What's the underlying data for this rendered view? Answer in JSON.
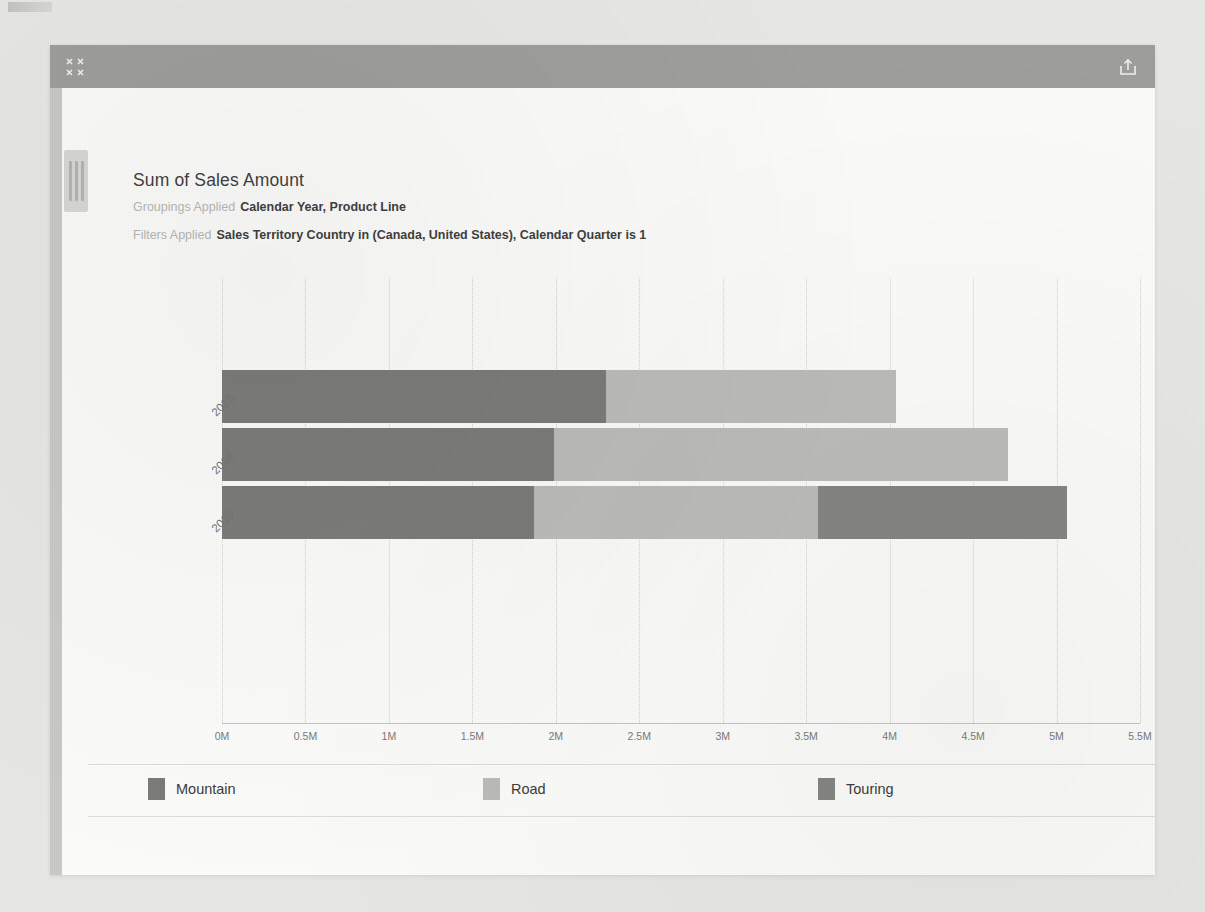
{
  "window": {
    "titlebar": {
      "collapse_icon": "collapse-arrows-icon",
      "share_icon": "share-export-icon"
    },
    "rail_grip": "panel-drag-handle"
  },
  "report": {
    "title": "Sum of Sales Amount",
    "groupings_label": "Groupings Applied",
    "groupings_value": "Calendar Year, Product Line",
    "filters_label": "Filters Applied",
    "filters_value": "Sales Territory Country in (Canada, United States), Calendar Quarter is 1"
  },
  "colors": {
    "mountain": "#7a7a78",
    "road": "#bcbcba",
    "touring": "#858583",
    "titlebar": "#9e9e9c",
    "grid": "#d2d2d0",
    "axis": "#c6c6c4"
  },
  "chart_data": {
    "type": "bar",
    "orientation": "horizontal",
    "stacked": true,
    "title": "Sum of Sales Amount",
    "xlabel": "",
    "ylabel": "",
    "categories": [
      "2013",
      "2014",
      "2015"
    ],
    "series": [
      {
        "name": "Mountain",
        "values": [
          2300000,
          1990000,
          1870000
        ]
      },
      {
        "name": "Road",
        "values": [
          1740000,
          2720000,
          1700000
        ]
      },
      {
        "name": "Touring",
        "values": [
          0,
          0,
          1490000
        ]
      }
    ],
    "totals": [
      4040000,
      4710000,
      5060000
    ],
    "xlim": [
      0,
      5500000
    ],
    "xticks": [
      {
        "value": 0,
        "label": "0M"
      },
      {
        "value": 500000,
        "label": "0.5M"
      },
      {
        "value": 1000000,
        "label": "1M"
      },
      {
        "value": 1500000,
        "label": "1.5M"
      },
      {
        "value": 2000000,
        "label": "2M"
      },
      {
        "value": 2500000,
        "label": "2.5M"
      },
      {
        "value": 3000000,
        "label": "3M"
      },
      {
        "value": 3500000,
        "label": "3.5M"
      },
      {
        "value": 4000000,
        "label": "4M"
      },
      {
        "value": 4500000,
        "label": "4.5M"
      },
      {
        "value": 5000000,
        "label": "5M"
      },
      {
        "value": 5500000,
        "label": "5.5M"
      }
    ],
    "grid": true,
    "legend_position": "bottom",
    "legend": [
      {
        "label": "Mountain",
        "color": "#7a7a78"
      },
      {
        "label": "Road",
        "color": "#bcbcba"
      },
      {
        "label": "Touring",
        "color": "#858583"
      }
    ]
  }
}
